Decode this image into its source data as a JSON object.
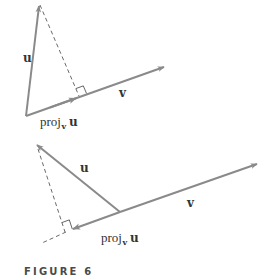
{
  "colors": {
    "vector": "#8a8a8a",
    "dashed": "#6a6a6a",
    "text": "#333333",
    "caption": "#4a4a4a",
    "background": "#ffffff"
  },
  "caption": "FIGURE 6",
  "diagrams": [
    {
      "name": "acute-angle-case",
      "labels": {
        "u": "u",
        "v": "v",
        "proj_main": "proj",
        "proj_sub": "v",
        "proj_vec": "u"
      }
    },
    {
      "name": "obtuse-angle-case",
      "labels": {
        "u": "u",
        "v": "v",
        "proj_main": "proj",
        "proj_sub": "v",
        "proj_vec": "u"
      }
    }
  ]
}
